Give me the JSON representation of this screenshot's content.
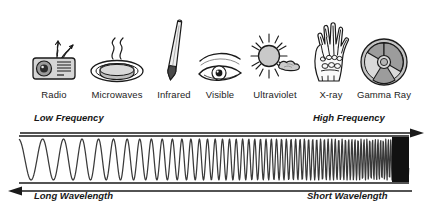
{
  "diagram": {
    "background_color": "#ffffff",
    "ink_color": "#1a1a1a"
  },
  "bands": [
    {
      "label": "Radio",
      "icon": "radio-icon",
      "center_x": 54,
      "glyph_width": 52
    },
    {
      "label": "Microwaves",
      "icon": "microwave-icon",
      "center_x": 117,
      "glyph_width": 58
    },
    {
      "label": "Infrared",
      "icon": "thermometer-icon",
      "center_x": 174,
      "glyph_width": 40
    },
    {
      "label": "Visible",
      "icon": "eye-icon",
      "center_x": 220,
      "glyph_width": 48
    },
    {
      "label": "Ultraviolet",
      "icon": "sun-cloud-icon",
      "center_x": 275,
      "glyph_width": 62
    },
    {
      "label": "X-ray",
      "icon": "xray-hand-icon",
      "center_x": 331,
      "glyph_width": 46
    },
    {
      "label": "Gamma Ray",
      "icon": "radiation-icon",
      "center_x": 384,
      "glyph_width": 50
    }
  ],
  "axes": {
    "frequency": {
      "low_label": "Low Frequency",
      "high_label": "High Frequency",
      "direction": "right"
    },
    "wavelength": {
      "long_label": "Long Wavelength",
      "short_label": "Short Wavelength",
      "direction": "left"
    }
  },
  "wave_panel": {
    "left": 19,
    "right": 409,
    "top": 137,
    "bottom": 184,
    "description": "sine wave with frequency increasing left to right, compressing to solid black at the right end",
    "start_wavelength": 26,
    "end_wavelength": 2.2
  },
  "chart_data": {
    "type": "line",
    "xlabel": "Frequency increasing → / Wavelength decreasing ←",
    "ylabel": "Amplitude",
    "categories": [
      "Radio",
      "Microwaves",
      "Infrared",
      "Visible",
      "Ultraviolet",
      "X-ray",
      "Gamma Ray"
    ],
    "series": [
      {
        "name": "Relative wavelength (arbitrary units, decreasing)",
        "values": [
          26,
          18,
          12,
          8,
          5.5,
          3.5,
          2.2
        ]
      }
    ],
    "legend": "none",
    "grid": false
  }
}
